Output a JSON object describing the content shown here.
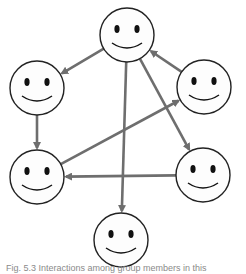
{
  "diagram": {
    "colors": {
      "edge": "#6e6e6e",
      "node_stroke": "#222222",
      "node_fill": "#fdfdfd",
      "face": "#111111"
    },
    "nodes": [
      {
        "id": "top",
        "x": 127,
        "y": 35,
        "r": 27
      },
      {
        "id": "left-upper",
        "x": 37,
        "y": 88,
        "r": 27
      },
      {
        "id": "right-upper",
        "x": 204,
        "y": 87,
        "r": 27
      },
      {
        "id": "left-lower",
        "x": 37,
        "y": 177,
        "r": 27
      },
      {
        "id": "right-lower",
        "x": 203,
        "y": 175,
        "r": 27
      },
      {
        "id": "bottom",
        "x": 121,
        "y": 240,
        "r": 27
      }
    ],
    "edges": [
      {
        "from": "top",
        "to": "left-upper"
      },
      {
        "from": "right-upper",
        "to": "top"
      },
      {
        "from": "left-upper",
        "to": "left-lower"
      },
      {
        "from": "top",
        "to": "bottom"
      },
      {
        "from": "top",
        "to": "right-lower"
      },
      {
        "from": "left-lower",
        "to": "right-upper"
      },
      {
        "from": "right-lower",
        "to": "left-lower"
      }
    ]
  },
  "caption": {
    "text": "Fig. 5.3 Interactions among group members in this"
  }
}
